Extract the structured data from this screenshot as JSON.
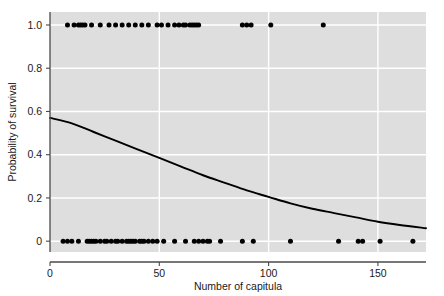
{
  "chart_data": {
    "type": "scatter",
    "title": "",
    "xlabel": "Number of capitula",
    "ylabel": "Probability of survival",
    "xlim": [
      0,
      172
    ],
    "ylim": [
      -0.05,
      1.06
    ],
    "xticks": [
      0,
      50,
      100,
      150
    ],
    "xticklabels": [
      "0",
      "50",
      "100",
      "150"
    ],
    "yticks": [
      0,
      0.2,
      0.4,
      0.6,
      0.8,
      1.0
    ],
    "yticklabels": [
      "0",
      "0.2",
      "0.4",
      "0.6",
      "0.8",
      "1.0"
    ],
    "grid": true,
    "legend": false,
    "panel_background": "#dedede",
    "gridline_color": "#ffffff",
    "point_color": "#000000",
    "curve_color": "#000000",
    "series": [
      {
        "name": "survived",
        "type": "scatter",
        "y_value": 1.0,
        "x": [
          8,
          11,
          13,
          14,
          15,
          16,
          19,
          23,
          27,
          30,
          33,
          36,
          39,
          42,
          45,
          49,
          51,
          54,
          57,
          59,
          61,
          62,
          64,
          65,
          66,
          67,
          68,
          88,
          90,
          92,
          101,
          125
        ]
      },
      {
        "name": "died",
        "type": "scatter",
        "y_value": 0.0,
        "x": [
          6,
          8,
          10,
          13,
          17,
          18,
          19,
          20,
          21,
          23,
          25,
          26,
          28,
          30,
          31,
          33,
          35,
          36,
          37,
          38,
          39,
          41,
          42,
          43,
          45,
          47,
          49,
          52,
          57,
          62,
          66,
          68,
          70,
          72,
          73,
          78,
          88,
          93,
          110,
          132,
          141,
          143,
          151,
          166
        ]
      },
      {
        "name": "logistic fit",
        "type": "line",
        "x": [
          0,
          10,
          20,
          30,
          40,
          50,
          60,
          70,
          80,
          90,
          100,
          110,
          120,
          130,
          140,
          150,
          160,
          172
        ],
        "y": [
          0.57,
          0.545,
          0.505,
          0.465,
          0.425,
          0.385,
          0.345,
          0.305,
          0.27,
          0.235,
          0.205,
          0.175,
          0.15,
          0.13,
          0.11,
          0.09,
          0.075,
          0.06
        ]
      }
    ]
  },
  "axes": {
    "xlabel": "Number of capitula",
    "ylabel": "Probability of survival"
  }
}
